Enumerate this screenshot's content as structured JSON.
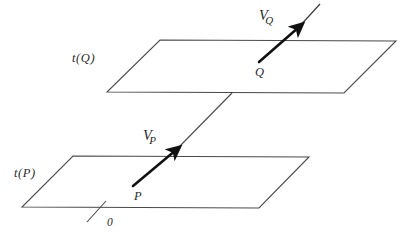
{
  "figure": {
    "background_color": "#ffffff",
    "line_color": "#4a4a4a",
    "vector_color": "#111111",
    "text_color": "#2b2b2b"
  },
  "planes": [
    {
      "id": "upper-plane",
      "label": "t(Q)",
      "label_position": {
        "x": 72,
        "y": 52
      },
      "corners": {
        "top_left": {
          "x": 160,
          "y": 40
        },
        "top_right": {
          "x": 396,
          "y": 41
        },
        "bottom_right": {
          "x": 344,
          "y": 93
        },
        "bottom_left": {
          "x": 107,
          "y": 92
        }
      }
    },
    {
      "id": "lower-plane",
      "label": "t(P)",
      "label_position": {
        "x": 14,
        "y": 167
      },
      "corners": {
        "top_left": {
          "x": 73,
          "y": 156
        },
        "top_right": {
          "x": 309,
          "y": 157
        },
        "bottom_right": {
          "x": 259,
          "y": 208
        },
        "bottom_left": {
          "x": 22,
          "y": 207
        }
      }
    }
  ],
  "points": [
    {
      "id": "point-Q",
      "label": "Q",
      "label_position": {
        "x": 255,
        "y": 66
      },
      "at": {
        "x": 259,
        "y": 62
      }
    },
    {
      "id": "point-P",
      "label": "P",
      "label_position": {
        "x": 134,
        "y": 190
      },
      "at": {
        "x": 133,
        "y": 186
      }
    }
  ],
  "vectors": [
    {
      "id": "vector-Q",
      "base_symbol": "V",
      "subscript": "Q",
      "label_position": {
        "x": 259,
        "y": 8
      },
      "tail": {
        "x": 259,
        "y": 62
      },
      "head": {
        "x": 301,
        "y": 25
      },
      "extension_tip": {
        "x": 320,
        "y": 4
      }
    },
    {
      "id": "vector-P",
      "base_symbol": "V",
      "subscript": "P",
      "label_position": {
        "x": 143,
        "y": 128
      },
      "tail": {
        "x": 133,
        "y": 186
      },
      "head": {
        "x": 178,
        "y": 148
      },
      "extension_tip": {
        "x": 232,
        "y": 93
      }
    }
  ],
  "origin": {
    "label": "0",
    "label_position": {
      "x": 107,
      "y": 217
    },
    "tick_start": {
      "x": 87,
      "y": 222
    },
    "tick_end": {
      "x": 106,
      "y": 201
    }
  },
  "connector": {
    "id": "plane-connector",
    "start": {
      "x": 178,
      "y": 148
    },
    "end": {
      "x": 232,
      "y": 93
    }
  }
}
